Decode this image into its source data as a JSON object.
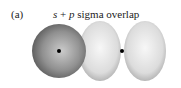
{
  "figure": {
    "panel_label": "(a)",
    "title_s": "s",
    "title_plus": " + ",
    "title_p": "p",
    "title_rest": " sigma overlap"
  },
  "colors": {
    "s_orbital_dark": "#555555",
    "s_orbital_light": "#bdbdbd",
    "p_lobe_light": "#f2f2f2",
    "p_lobe_dark": "#b8b8b8",
    "nucleus": "#000000"
  }
}
